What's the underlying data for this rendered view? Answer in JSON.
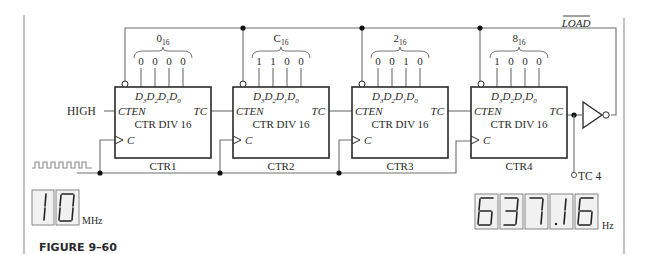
{
  "figure": {
    "caption": "FIGURE 9–60"
  },
  "signals": {
    "load": "LOAD",
    "high": "HIGH",
    "tc_output": "TC 4"
  },
  "counters": [
    {
      "name": "CTR1",
      "function": "CTR DIV 16",
      "enable": "CTEN",
      "terminal": "TC",
      "clock": "C",
      "preset_hex": "0",
      "preset_base": "16",
      "bits": [
        "0",
        "0",
        "0",
        "0"
      ]
    },
    {
      "name": "CTR2",
      "function": "CTR DIV 16",
      "enable": "CTEN",
      "terminal": "TC",
      "clock": "C",
      "preset_hex": "C",
      "preset_base": "16",
      "bits": [
        "1",
        "1",
        "0",
        "0"
      ]
    },
    {
      "name": "CTR3",
      "function": "CTR DIV 16",
      "enable": "CTEN",
      "terminal": "TC",
      "clock": "C",
      "preset_hex": "2",
      "preset_base": "16",
      "bits": [
        "0",
        "0",
        "1",
        "0"
      ]
    },
    {
      "name": "CTR4",
      "function": "CTR DIV 16",
      "enable": "CTEN",
      "terminal": "TC",
      "clock": "C",
      "preset_hex": "8",
      "preset_base": "16",
      "bits": [
        "1",
        "0",
        "0",
        "0"
      ]
    }
  ],
  "data_inputs": [
    "D3",
    "D2",
    "D1",
    "D0"
  ],
  "input_display": {
    "digits": [
      "1",
      "0"
    ],
    "unit": "MHz"
  },
  "output_display": {
    "digits": [
      "6",
      "3",
      "7",
      ".7",
      "6"
    ],
    "value": "637.76",
    "unit": "Hz"
  },
  "colors": {
    "wire": "#6e6e6e",
    "box": "#2a2a2a",
    "display_bg": "#f1f1f1"
  }
}
